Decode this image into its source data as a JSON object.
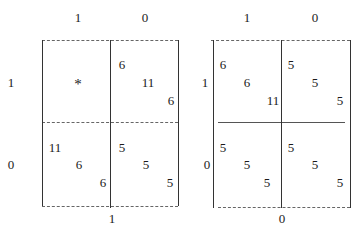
{
  "left_game": {
    "col_labels": [
      "1",
      "0"
    ],
    "row_labels": [
      "1",
      "0"
    ],
    "bottom_label": "1",
    "cells": {
      "r1c1": {
        "marker": "*"
      },
      "r1c2": {
        "values": [
          "6",
          "11",
          "6"
        ]
      },
      "r2c1": {
        "values": [
          "11",
          "6",
          "6"
        ]
      },
      "r2c2": {
        "values": [
          "5",
          "5",
          "5"
        ]
      }
    }
  },
  "right_game": {
    "col_labels": [
      "1",
      "0"
    ],
    "row_labels": [
      "1",
      "0"
    ],
    "bottom_label": "0",
    "cells": {
      "r1c1": {
        "values": [
          "6",
          "6",
          "11"
        ]
      },
      "r1c2": {
        "values": [
          "5",
          "5",
          "5"
        ]
      },
      "r2c1": {
        "values": [
          "5",
          "5",
          "5"
        ]
      },
      "r2c2": {
        "values": [
          "5",
          "5",
          "5"
        ]
      }
    }
  }
}
